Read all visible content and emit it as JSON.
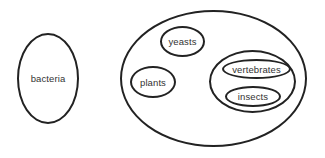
{
  "diagram": {
    "type": "venn-set-diagram",
    "sets": {
      "bacteria": {
        "label": "bacteria"
      },
      "eukaryotes": {
        "label": "",
        "children": {
          "yeasts": {
            "label": "yeasts"
          },
          "plants": {
            "label": "plants"
          },
          "animals": {
            "label": "",
            "children": {
              "vertebrates": {
                "label": "vertebrates"
              },
              "insects": {
                "label": "insects"
              }
            }
          }
        }
      }
    },
    "stroke_color": "#222222",
    "text_color": "#333333",
    "background": "#ffffff"
  }
}
